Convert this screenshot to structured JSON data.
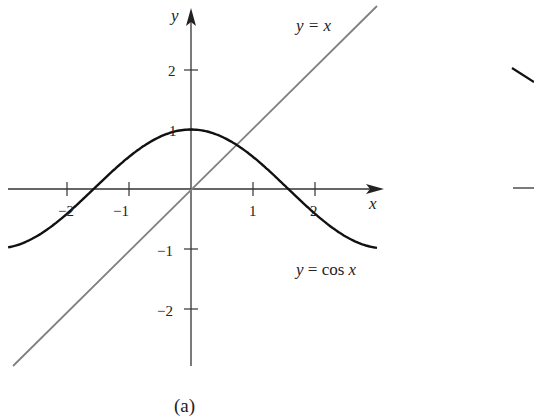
{
  "chart_data": {
    "type": "line",
    "title": "",
    "caption": "(a)",
    "xlabel": "x",
    "ylabel": "y",
    "xlim": [
      -2.95,
      3.0
    ],
    "ylim": [
      -2.95,
      3.0
    ],
    "x_ticks": [
      -2,
      -1,
      1,
      2
    ],
    "x_tick_labels": [
      "−2",
      "−1",
      "1",
      "2"
    ],
    "y_ticks": [
      2,
      1,
      -1,
      -2
    ],
    "y_tick_labels": [
      "2",
      "1",
      "−1",
      "−2"
    ],
    "grid": false,
    "series": [
      {
        "name": "y = cos x",
        "function": "cos(x)",
        "x_range": [
          -2.95,
          3.0
        ],
        "color": "#111111",
        "width": 2.4
      },
      {
        "name": "y = x",
        "function": "x",
        "x_range": [
          -2.86,
          3.0
        ],
        "color": "#777777",
        "width": 1.8
      }
    ],
    "annotations": [
      {
        "text": "y = x",
        "near": "upper right of line"
      },
      {
        "text": "y = cos x",
        "near": "right, below x-axis"
      }
    ]
  },
  "labels": {
    "x_axis": "x",
    "y_axis": "y",
    "line_label": "y = x",
    "curve_label": "y = cos x",
    "caption": "(a)",
    "xt": [
      "−2",
      "−1",
      "1",
      "2"
    ],
    "yt": [
      "2",
      "1",
      "−1",
      "−2"
    ]
  }
}
